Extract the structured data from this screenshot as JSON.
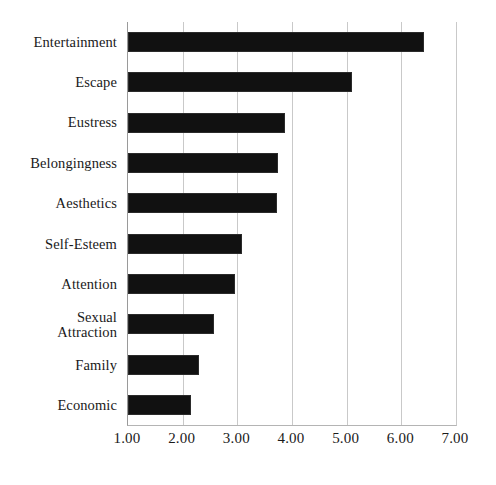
{
  "chart_data": {
    "type": "bar",
    "orientation": "horizontal",
    "title": "",
    "subtitle": "",
    "xlabel": "",
    "ylabel": "",
    "xlim": [
      1.0,
      7.0
    ],
    "grid": true,
    "legend": false,
    "legend_position": "none",
    "bar_color": "#111111",
    "gridline_color": "#c9c9c9",
    "axis_color": "#9a9a9a",
    "background_color": "#ffffff",
    "xticks": [
      "1.00",
      "2.00",
      "3.00",
      "4.00",
      "5.00",
      "6.00",
      "7.00"
    ],
    "xtick_values": [
      1.0,
      2.0,
      3.0,
      4.0,
      5.0,
      6.0,
      7.0
    ],
    "categories": [
      "Entertainment",
      "Escape",
      "Eustress",
      "Belongingness",
      "Aesthetics",
      "Self-Esteem",
      "Attention",
      "Sexual\nAttraction",
      "Family",
      "Economic"
    ],
    "values": [
      6.42,
      5.09,
      3.87,
      3.75,
      3.72,
      3.09,
      2.96,
      2.58,
      2.29,
      2.15
    ]
  }
}
